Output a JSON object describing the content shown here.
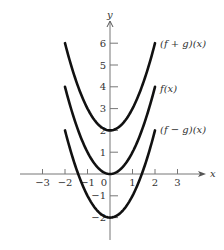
{
  "chart_data": {
    "type": "line",
    "title": "",
    "xlabel": "x",
    "ylabel": "y",
    "xlim": [
      -3.9,
      3.6
    ],
    "ylim": [
      -3,
      7.1
    ],
    "grid": false,
    "legend": "inline labels at right end of curves",
    "x_ticks": [
      -3,
      -2,
      -1,
      0,
      1,
      2,
      3
    ],
    "x_tick_labels": [
      "−3",
      "−2",
      "−1",
      "0",
      "1",
      "2",
      "3"
    ],
    "y_ticks": [
      -2,
      -1,
      1,
      2,
      3,
      4,
      5,
      6
    ],
    "y_tick_labels": [
      "−2",
      "−1",
      "1",
      "2",
      "3",
      "4",
      "5",
      "6"
    ],
    "x_domain": [
      -2,
      2
    ],
    "series": [
      {
        "name": "(f + g)(x)",
        "formula": "x^2 + 2",
        "x": [
          -2,
          -1.5,
          -1,
          -0.5,
          0,
          0.5,
          1,
          1.5,
          2
        ],
        "values": [
          6,
          4.25,
          3,
          2.25,
          2,
          2.25,
          3,
          4.25,
          6
        ],
        "color": "#111111"
      },
      {
        "name": "f(x)",
        "formula": "x^2",
        "x": [
          -2,
          -1.5,
          -1,
          -0.5,
          0,
          0.5,
          1,
          1.5,
          2
        ],
        "values": [
          4,
          2.25,
          1,
          0.25,
          0,
          0.25,
          1,
          2.25,
          4
        ],
        "color": "#111111"
      },
      {
        "name": "(f − g)(x)",
        "formula": "x^2 - 2",
        "x": [
          -2,
          -1.5,
          -1,
          -0.5,
          0,
          0.5,
          1,
          1.5,
          2
        ],
        "values": [
          2,
          0.25,
          -1,
          -1.75,
          -2,
          -1.75,
          -1,
          0.25,
          2
        ],
        "color": "#111111"
      }
    ]
  },
  "layout": {
    "origin_px": [
      110,
      174
    ],
    "x_scale_px": 22.5,
    "y_scale_px": 21.8,
    "x_axis_px": [
      20,
      200
    ],
    "y_axis_px": [
      240,
      22
    ],
    "tick_len_px": 5
  },
  "labels": {
    "x_axis": "x",
    "y_axis": "y",
    "fplusg": "(f + g)(x)",
    "f": "f(x)",
    "fminusg": "(f − g)(x)"
  }
}
